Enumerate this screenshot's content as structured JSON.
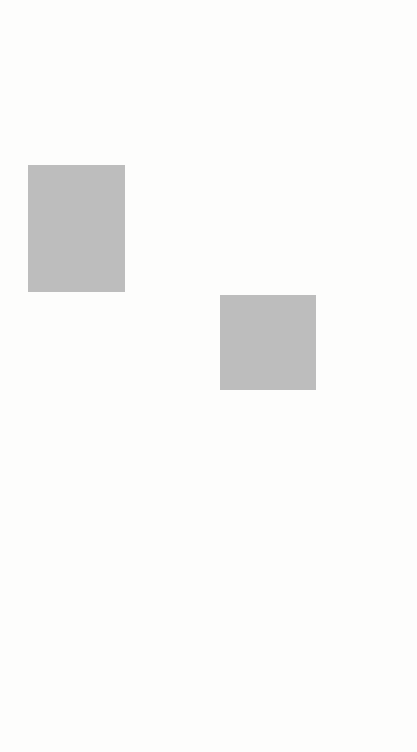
{
  "notes_right": {
    "first_day": [
      "First DAY of",
      "Unleavened Bread."
    ],
    "begins_day": [
      "Begins DAY of",
      "Passover Sacrifice."
    ],
    "morning": [
      "Morning burnt offer-",
      "ing–9 a.m.",
      "Numbers",
      "28:4.",
      "Exodus 29:39."
    ],
    "lamb": [
      "THE LAMB SLAIN–",
      "3 p.m.",
      "Exodus 12:6."
    ]
  },
  "chart": {
    "row_top": {
      "label_13": "13th",
      "label_14": "14th",
      "mark_5": "*5",
      "mark_6": "*6"
    },
    "row_mid": {
      "fifth_day": "Fifth Day",
      "sixth_day": "Sixth Day",
      "preparation": [
        "THE",
        "P",
        "R",
        "E",
        "P",
        "A",
        "R",
        "A",
        "T",
        "I",
        "O",
        "N"
      ]
    },
    "row_bottom": {
      "thursday": "Thursday",
      "friday": "Friday",
      "times": [
        "3 a.m.",
        "6 a.m.",
        "9 a.m."
      ]
    },
    "first_day_box": [
      "1st",
      "Day"
    ],
    "continues": "(Chart continues.)"
  },
  "events": {
    "disciples": [
      "Disciples sent to Jerusalem to make preparations",
      "for Passover.",
      "Mark 14:12, 16"
    ],
    "supper": [
      "THE LAST SUPPER.",
      "Mark 14:17-25"
    ],
    "olives": [
      "After supper to Mount of Olives.",
      "Mark 14:26; 32-42"
    ],
    "betrayal": [
      "Betrayal and Arrest.",
      "Mark 14:43-52",
      "(Christ prophesied His"
    ],
    "betrayal2": [
      "betrayal to be on Nisan 14,",
      "Mark 14:1; Matthew 26:2."
    ],
    "words": [
      "The words",
      "the feast of",
      "are supplied by translators.)"
    ],
    "trial": [
      "Jewish trial at night.",
      "Mark 14:53-65"
    ],
    "peter": [
      "Peter's third denial.",
      "Mark 14:72"
    ],
    "pilate": [
      "To Pilate and Herod.",
      "Mark 15:1-5.",
      "Pilate's judgment.",
      "John 19:14"
    ],
    "nailed": [
      "JESUS NAILED TO THE CROSS.",
      "Mark 15:25"
    ],
    "descends": [
      "JESUS DESCENDS INTO HEART OF THE",
      "EARTH.",
      "Mark 15:33-37"
    ]
  }
}
